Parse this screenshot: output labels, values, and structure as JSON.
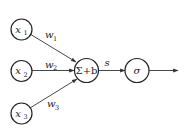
{
  "diagram": {
    "type": "neuron / perceptron",
    "colors": {
      "stroke": "#222222",
      "background": "#ffffff"
    },
    "inputs": [
      {
        "var": "x",
        "sub": "1",
        "weight_var": "w",
        "weight_sub": "1"
      },
      {
        "var": "x",
        "sub": "2",
        "weight_var": "w",
        "weight_sub": "2"
      },
      {
        "var": "x",
        "sub": "3",
        "weight_var": "w",
        "weight_sub": "3"
      }
    ],
    "sum_node": {
      "label": "Σ+b"
    },
    "intermediate_label": "s",
    "activation_node": {
      "label": "σ"
    },
    "output": {
      "label": ""
    }
  }
}
